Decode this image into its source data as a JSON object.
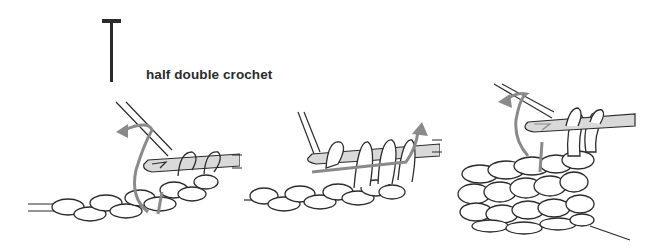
{
  "title": {
    "symbol": "half-double-crochet-symbol",
    "label": "half double crochet"
  },
  "colors": {
    "background": "#ffffff",
    "outline": "#2b2b2b",
    "hook_fill": "#d9d9d9",
    "arrow": "#8a8a8a",
    "yarn_fill": "#ffffff"
  },
  "steps": [
    {
      "id": 1,
      "description": "yarn over, insert hook into stitch, yarn over and pull up loop"
    },
    {
      "id": 2,
      "description": "yarn over and pull through all three loops on hook"
    },
    {
      "id": 3,
      "description": "completed rows of half double crochet, turning to start next row"
    }
  ]
}
